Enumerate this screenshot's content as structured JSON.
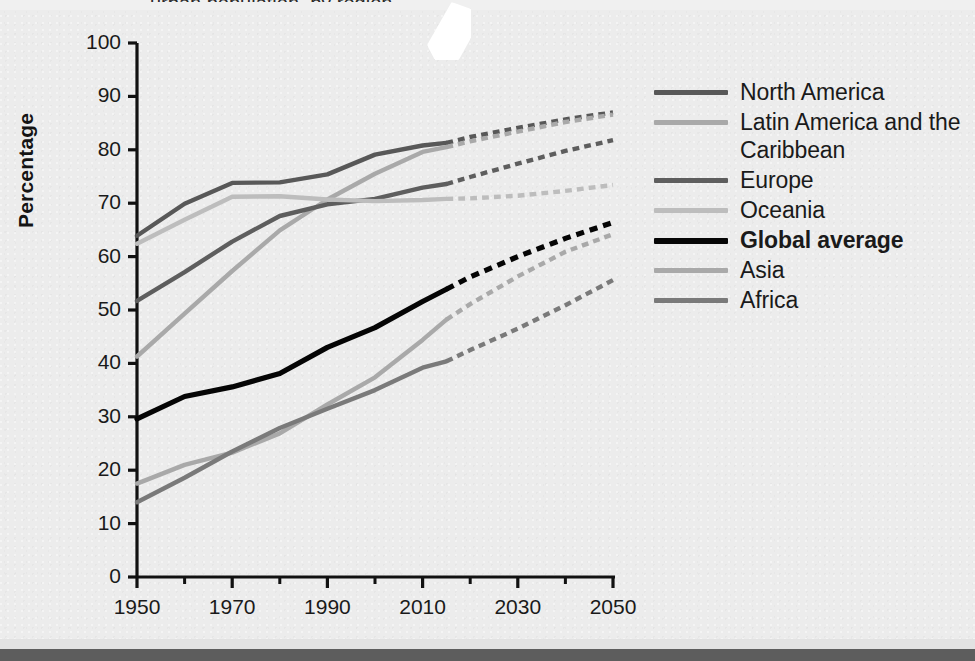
{
  "figure": {
    "background_color": "#ececec",
    "title_partial": "urban population, by region",
    "sticker_note": "white-paper-fragment"
  },
  "chart_data": {
    "type": "line",
    "title": "",
    "xlabel": "",
    "ylabel": "Percentage",
    "xlim": [
      1950,
      2050
    ],
    "ylim": [
      0,
      100
    ],
    "grid": false,
    "legend_position": "right",
    "x_ticks": [
      1950,
      1970,
      1990,
      2010,
      2030,
      2050
    ],
    "x_minor_ticks": [
      1960,
      1980,
      2000,
      2020,
      2040
    ],
    "y_ticks": [
      0,
      10,
      20,
      30,
      40,
      50,
      60,
      70,
      80,
      90,
      100
    ],
    "projection_start_year": 2015,
    "x": [
      1950,
      1960,
      1970,
      1980,
      1990,
      2000,
      2010,
      2015,
      2020,
      2030,
      2040,
      2050
    ],
    "series": [
      {
        "name": "North America",
        "color": "#585858",
        "values": [
          63.9,
          69.9,
          73.8,
          73.9,
          75.4,
          79.1,
          80.8,
          81.3,
          82.4,
          84.1,
          85.7,
          87.0
        ]
      },
      {
        "name": "Latin America and the Caribbean",
        "color": "#a9a9a9",
        "values": [
          41.3,
          49.3,
          57.3,
          64.9,
          70.7,
          75.5,
          79.6,
          80.5,
          81.6,
          83.4,
          85.2,
          86.6
        ]
      },
      {
        "name": "Europe",
        "color": "#5e5e5e",
        "values": [
          51.7,
          57.1,
          62.8,
          67.6,
          69.8,
          70.8,
          72.9,
          73.6,
          74.9,
          77.4,
          79.8,
          81.8
        ]
      },
      {
        "name": "Oceania",
        "color": "#bdbdbd",
        "values": [
          62.4,
          66.9,
          71.2,
          71.3,
          70.7,
          70.4,
          70.6,
          70.8,
          70.9,
          71.4,
          72.3,
          73.4
        ]
      },
      {
        "name": "Global average",
        "color": "#050505",
        "values": [
          29.6,
          33.8,
          35.6,
          38.1,
          43.0,
          46.7,
          51.6,
          53.9,
          56.2,
          60.0,
          63.4,
          66.4
        ]
      },
      {
        "name": "Asia",
        "color": "#a9a9a9",
        "values": [
          17.5,
          21.0,
          23.3,
          26.9,
          32.3,
          37.4,
          44.4,
          48.2,
          51.1,
          56.3,
          60.9,
          64.2
        ]
      },
      {
        "name": "Africa",
        "color": "#7a7a7a",
        "values": [
          14.0,
          18.6,
          23.5,
          27.9,
          31.5,
          35.0,
          39.2,
          40.4,
          42.5,
          46.5,
          50.9,
          55.6
        ]
      }
    ]
  },
  "legend": {
    "items": [
      {
        "label": "North America",
        "color": "#585858",
        "bold": false,
        "swatch": "legend-line-north-america"
      },
      {
        "label": "Latin America and the Caribbean",
        "color": "#a9a9a9",
        "bold": false,
        "swatch": "legend-line-latin-america"
      },
      {
        "label": "Europe",
        "color": "#5e5e5e",
        "bold": false,
        "swatch": "legend-line-europe"
      },
      {
        "label": "Oceania",
        "color": "#bdbdbd",
        "bold": false,
        "swatch": "legend-line-oceania"
      },
      {
        "label": "Global average",
        "color": "#050505",
        "bold": true,
        "swatch": "legend-line-global-average"
      },
      {
        "label": "Asia",
        "color": "#a9a9a9",
        "bold": false,
        "swatch": "legend-line-asia"
      },
      {
        "label": "Africa",
        "color": "#7a7a7a",
        "bold": false,
        "swatch": "legend-line-africa"
      }
    ]
  },
  "axis": {
    "y_title": "Percentage",
    "y_tick_labels": [
      "100",
      "90",
      "80",
      "70",
      "60",
      "50",
      "40",
      "30",
      "20",
      "10",
      "0"
    ],
    "x_tick_labels": [
      "1950",
      "1970",
      "1990",
      "2010",
      "2030",
      "2050"
    ]
  }
}
